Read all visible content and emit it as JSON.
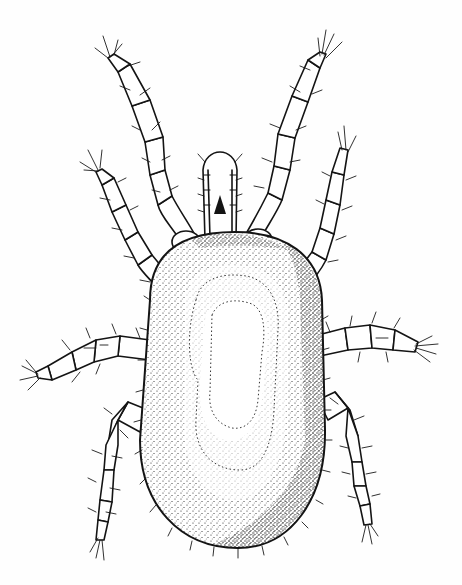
{
  "figure": {
    "subject": "mite",
    "view": "dorsal",
    "style": "pen-and-ink stipple illustration",
    "background_color": "#ffffff",
    "ink_color": "#141414",
    "legs": {
      "count": 8,
      "pairs": [
        "leg-I",
        "leg-II",
        "leg-III",
        "leg-IV"
      ]
    },
    "parts": [
      "gnathosoma",
      "idiosoma",
      "dorsal-shield",
      "setae"
    ]
  }
}
